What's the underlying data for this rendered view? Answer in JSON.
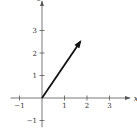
{
  "chart_data": {
    "type": "vector-plot",
    "title": "",
    "xlabel": "x",
    "ylabel": "y",
    "xlim": [
      -1.4,
      3.9
    ],
    "ylim": [
      -1.3,
      4.3
    ],
    "x_ticks": [
      -1,
      1,
      2,
      3
    ],
    "y_ticks": [
      -1,
      1,
      2,
      3
    ],
    "x_tick_labels": [
      "−1",
      "1",
      "2",
      "3"
    ],
    "y_tick_labels": [
      "−1",
      "1",
      "2",
      "3"
    ],
    "grid": false,
    "vectors": [
      {
        "name": "v",
        "tail": [
          0,
          0
        ],
        "head": [
          1.7,
          2.5
        ]
      }
    ]
  },
  "colors": {
    "axis": "#555555",
    "vector": "#111111"
  }
}
